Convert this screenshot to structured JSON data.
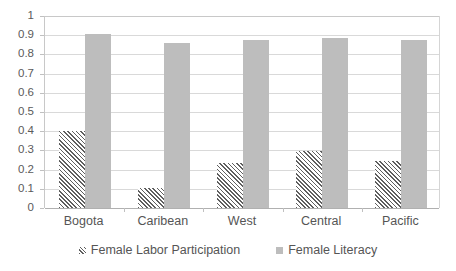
{
  "chart_data": {
    "type": "bar",
    "title": "",
    "subtitle": "",
    "xlabel": "",
    "ylabel": "",
    "categories": [
      "Bogota",
      "Caribean",
      "West",
      "Central",
      "Pacific"
    ],
    "series": [
      {
        "name": "Female Labor Participation",
        "style": "diagonal-hatch",
        "color": "#5f5f5f",
        "values": [
          0.4,
          0.105,
          0.235,
          0.295,
          0.245
        ]
      },
      {
        "name": "Female Literacy",
        "style": "solid",
        "color": "#bdbdbd",
        "values": [
          0.905,
          0.86,
          0.877,
          0.885,
          0.873
        ]
      }
    ],
    "ylim": [
      0,
      1
    ],
    "ytick_values": [
      0,
      0.1,
      0.2,
      0.3,
      0.4,
      0.5,
      0.6,
      0.7,
      0.8,
      0.9,
      1
    ],
    "ytick_labels": [
      "0",
      "0.1",
      "0.2",
      "0.3",
      "0.4",
      "0.5",
      "0.6",
      "0.7",
      "0.8",
      "0.9",
      "1"
    ],
    "grid": true,
    "grid_axis": "y",
    "legend_position": "bottom",
    "legend_entries": [
      "Female Labor Participation",
      "Female Literacy"
    ],
    "background_color": "#ffffff",
    "gridline_color": "#d9d9d9"
  }
}
